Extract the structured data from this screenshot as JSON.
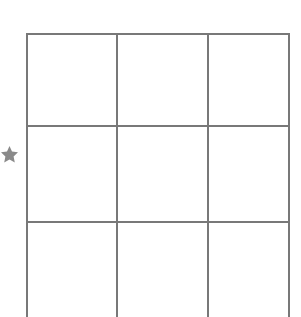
{
  "canvas": {
    "width": 301,
    "height": 317,
    "background_color": "#ffffff"
  },
  "grid": {
    "label": "3 by 3 grid",
    "columns": 3,
    "rows": 3,
    "line_color": "#787878",
    "line_width": 2,
    "cell_fill": "#ffffff",
    "left": 26,
    "right": 290,
    "top": 33,
    "column_x": [
      26,
      117,
      208,
      290
    ],
    "row_y": [
      33,
      126,
      222,
      318
    ],
    "bottom_clipped": true,
    "cells": [
      [
        {
          "name": "cell-r1c1",
          "value": ""
        },
        {
          "name": "cell-r1c2",
          "value": ""
        },
        {
          "name": "cell-r1c3",
          "value": ""
        }
      ],
      [
        {
          "name": "cell-r2c1",
          "value": ""
        },
        {
          "name": "cell-r2c2",
          "value": ""
        },
        {
          "name": "cell-r2c3",
          "value": ""
        }
      ],
      [
        {
          "name": "cell-r3c1",
          "value": ""
        },
        {
          "name": "cell-r3c2",
          "value": ""
        },
        {
          "name": "cell-r3c3",
          "value": ""
        }
      ]
    ]
  },
  "markers": [
    {
      "name": "row-marker-star",
      "icon": "star-icon",
      "color": "#8a8a8a",
      "center_x": 9,
      "center_y": 154,
      "size": 17,
      "points": 5,
      "marks_row": 2
    }
  ]
}
